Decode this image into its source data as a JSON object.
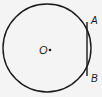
{
  "diagram": {
    "type": "circle-with-chord",
    "circle": {
      "center_label": "O",
      "cx": 47,
      "cy": 48,
      "r": 44
    },
    "chord": {
      "x": 87,
      "y1": 22,
      "y2": 76
    },
    "points": [
      {
        "label": "A",
        "x": 94,
        "y": 23
      },
      {
        "label": "B",
        "x": 94,
        "y": 82
      }
    ],
    "center_label_pos": {
      "x": 40,
      "y": 53
    },
    "colors": {
      "stroke": "#1a1a1a",
      "background": "#f4f4f4"
    }
  }
}
